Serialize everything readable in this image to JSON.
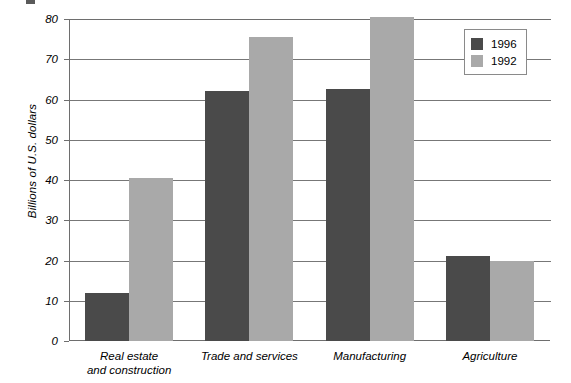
{
  "chart_data": {
    "type": "bar",
    "title": "",
    "subtitle": "",
    "xlabel": "",
    "ylabel": "Billions of U.S. dollars",
    "ylim": [
      0,
      80
    ],
    "yticks": [
      0,
      10,
      20,
      30,
      40,
      50,
      60,
      70,
      80
    ],
    "ytick_labels": [
      "0",
      "10",
      "20",
      "30",
      "40",
      "50",
      "60",
      "70",
      "80"
    ],
    "grid": "horizontal",
    "legend_position": "top-right",
    "categories": [
      "Real estate and construction",
      "Trade and services",
      "Manufacturing",
      "Agriculture"
    ],
    "category_lines": [
      [
        "Real estate",
        "and construction"
      ],
      [
        "Trade and services"
      ],
      [
        "Manufacturing"
      ],
      [
        "Agriculture"
      ]
    ],
    "series": [
      {
        "name": "1996",
        "color": "#4a4a4a",
        "values": [
          12,
          62,
          62.5,
          21
        ]
      },
      {
        "name": "1992",
        "color": "#a9a9a9",
        "values": [
          40.5,
          75.5,
          80.5,
          20
        ]
      }
    ]
  },
  "legend": {
    "entries": [
      {
        "label": "1996",
        "color": "#4a4a4a"
      },
      {
        "label": "1992",
        "color": "#a9a9a9"
      }
    ]
  }
}
